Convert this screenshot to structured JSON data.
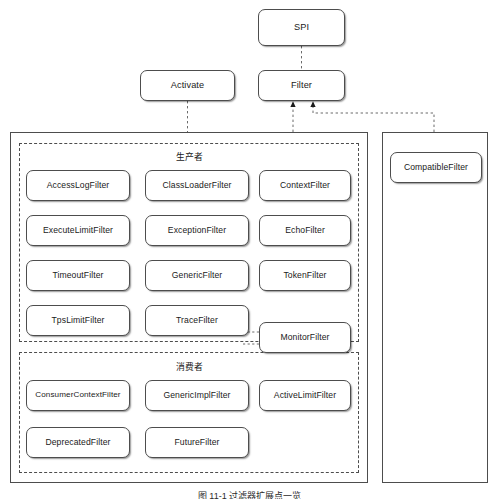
{
  "diagram": {
    "title_caption": "图 11-1  过滤器扩展点一览",
    "top_nodes": [
      {
        "id": "spi",
        "label": "SPI"
      },
      {
        "id": "activate",
        "label": "Activate"
      },
      {
        "id": "filter",
        "label": "Filter"
      }
    ],
    "groups": {
      "provider": {
        "label": "生产者"
      },
      "consumer": {
        "label": "消费者"
      }
    },
    "provider_filters": [
      "AccessLogFilter",
      "ClassLoaderFilter",
      "ContextFilter",
      "ExecuteLimitFilter",
      "ExceptionFilter",
      "EchoFilter",
      "TimeoutFilter",
      "GenericFilter",
      "TokenFilter",
      "TpsLimitFilter",
      "TraceFilter"
    ],
    "consumer_filters": [
      "ConsumerContextFilter",
      "GenericImplFilter",
      "ActiveLimitFilter",
      "DeprecatedFilter",
      "FutureFilter"
    ],
    "straddle_filter": "MonitorFilter",
    "right_panel_filters": [
      "CompatibleFilter"
    ],
    "colors": {
      "stroke": "#4d4d4d",
      "text": "#1a1a1a",
      "background": "#ffffff"
    }
  }
}
